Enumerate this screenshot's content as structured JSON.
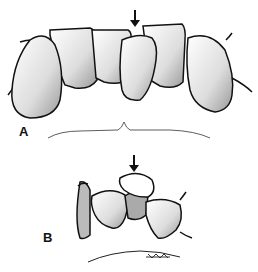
{
  "figure": {
    "panels": [
      {
        "label": "A",
        "description": "Facial view of anterior teeth with one tooth displaced (arrow)"
      },
      {
        "label": "B",
        "description": "Occlusal view of teeth with displaced tooth (arrow)"
      }
    ],
    "signature": "artist signature"
  }
}
